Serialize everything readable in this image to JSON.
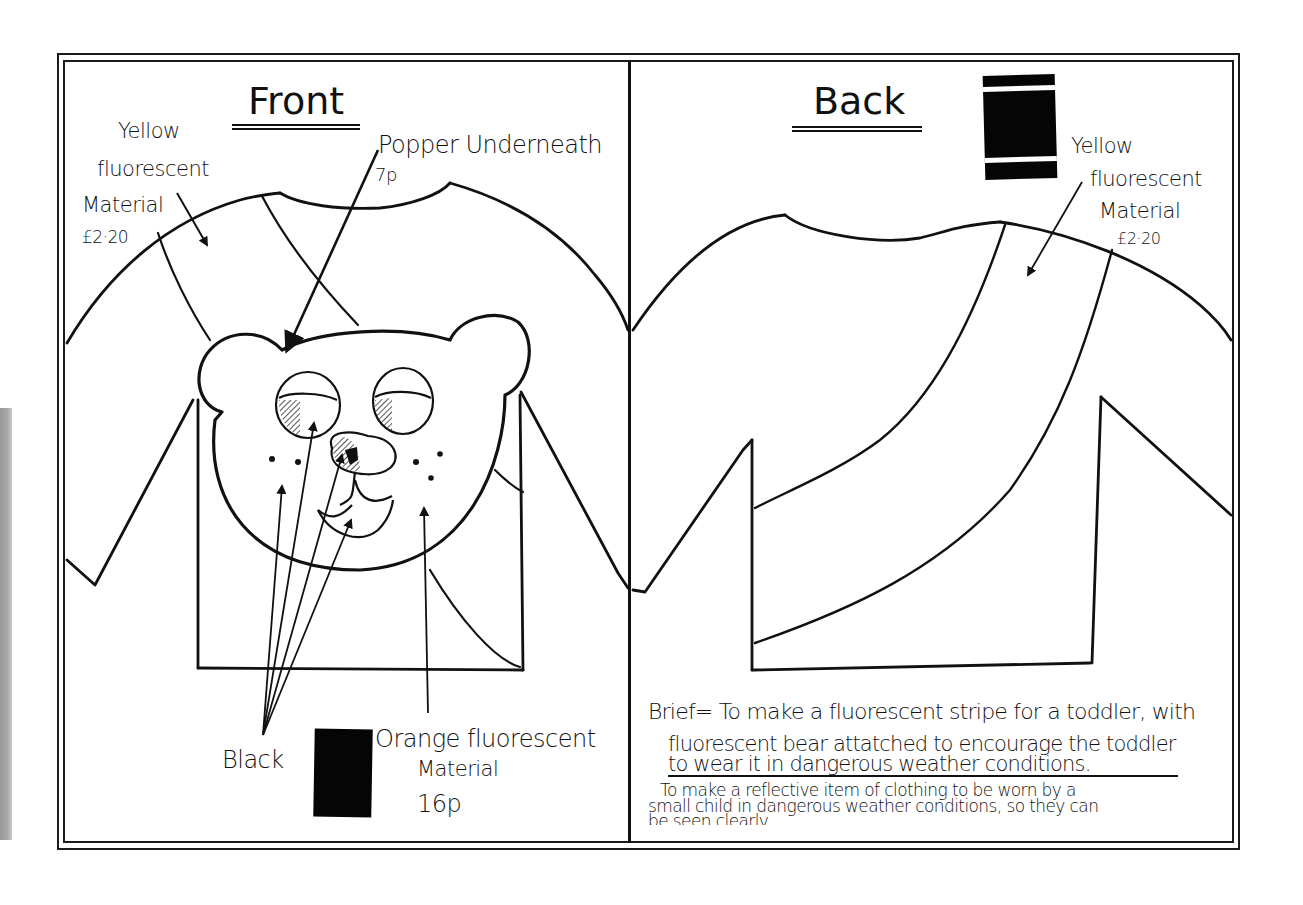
{
  "sheet": {
    "colors": {
      "ink": "#111111",
      "paper": "#ffffff",
      "scan_strip": "#a3a3a3",
      "swatch": "#050505"
    }
  },
  "front_panel": {
    "title": "Front",
    "annotations": {
      "yellow_material": {
        "lines": [
          "Yellow",
          "fluorescent",
          "Material",
          "£2·20"
        ]
      },
      "popper": {
        "line1": "Popper Underneath",
        "price": "7p"
      },
      "black": {
        "label": "Black"
      },
      "orange_material": {
        "lines": [
          "Orange fluorescent",
          "Material",
          "16p"
        ]
      }
    },
    "swatch": {
      "name": "orange-fluorescent-swatch",
      "color": "#050505"
    }
  },
  "back_panel": {
    "title": "Back",
    "annotations": {
      "yellow_material": {
        "lines": [
          "Yellow",
          "fluorescent",
          "Material",
          "£2·20"
        ]
      }
    },
    "swatch": {
      "name": "yellow-fluorescent-swatch",
      "color": "#050505",
      "band_color": "#ffffff"
    },
    "brief": {
      "line1": "Brief= To make a fluorescent stripe for a toddler, with",
      "line2": "fluorescent bear attatched to encourage the toddler",
      "line3": "to wear it in dangerous weather conditions.",
      "note_line1": "To make a reflective item of clothing to be worn by a",
      "note_line2": "small child in dangerous weather conditions, so they can",
      "note_line3": "be seen clearly"
    }
  }
}
